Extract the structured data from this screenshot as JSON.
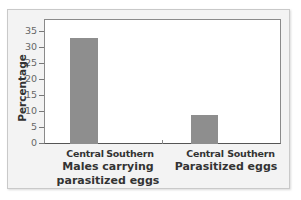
{
  "chart_data": {
    "type": "bar",
    "title": "",
    "xlabel": "",
    "ylabel": "Percentage",
    "ylim": [
      0,
      38
    ],
    "yticks": [
      0,
      5,
      10,
      15,
      20,
      25,
      30,
      35
    ],
    "grid": false,
    "legend": null,
    "groups": [
      {
        "label_lines": [
          "Males carrying",
          "parasitized eggs"
        ],
        "categories": [
          "Central",
          "Southern"
        ],
        "values": [
          33,
          0
        ]
      },
      {
        "label_lines": [
          "Parasitized eggs"
        ],
        "categories": [
          "Central",
          "Southern"
        ],
        "values": [
          9,
          0
        ]
      }
    ],
    "bar_color": "#8e8e8e"
  },
  "labels": {
    "ylabel": "Percentage",
    "yticks": [
      "0",
      "5",
      "10",
      "15",
      "20",
      "25",
      "30",
      "35"
    ],
    "g1_cat1": "Central",
    "g1_cat2": "Southern",
    "g1_line1": "Males carrying",
    "g1_line2": "parasitized eggs",
    "g2_cat1": "Central",
    "g2_cat2": "Southern",
    "g2_line1": "Parasitized eggs"
  }
}
